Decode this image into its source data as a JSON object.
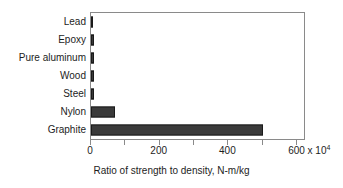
{
  "chart_data": {
    "type": "bar",
    "orientation": "horizontal",
    "title": "",
    "xlabel": "Ratio of strength to density, N-m/kg",
    "ylabel": "",
    "categories": [
      "Lead",
      "Epoxy",
      "Pure aluminum",
      "Wood",
      "Steel",
      "Nylon",
      "Graphite"
    ],
    "values": [
      5,
      8,
      8,
      9,
      8,
      70,
      500
    ],
    "series": [
      {
        "name": "Ratio of strength to density",
        "values": [
          5,
          8,
          8,
          9,
          8,
          70,
          500
        ]
      }
    ],
    "xlim": [
      0,
      620
    ],
    "ylim": [
      0,
      7
    ],
    "x_tick_values": [
      0,
      200,
      400,
      600
    ],
    "x_tick_labels": [
      "0",
      "200",
      "400",
      "600"
    ],
    "x_minor_tick_values": [
      100,
      300,
      500
    ],
    "x_unit_multiplier": "x 10",
    "x_unit_exponent": "4",
    "x_last_tick_label": "600 x 10",
    "grid": false,
    "legend": false,
    "legend_position": "none",
    "bar_color": "#3a3a3a",
    "bar_edge_color": "#1a1a1a",
    "frame_color": "#8a8a8a",
    "text_color": "#1d1d1d",
    "background": "#ffffff"
  }
}
